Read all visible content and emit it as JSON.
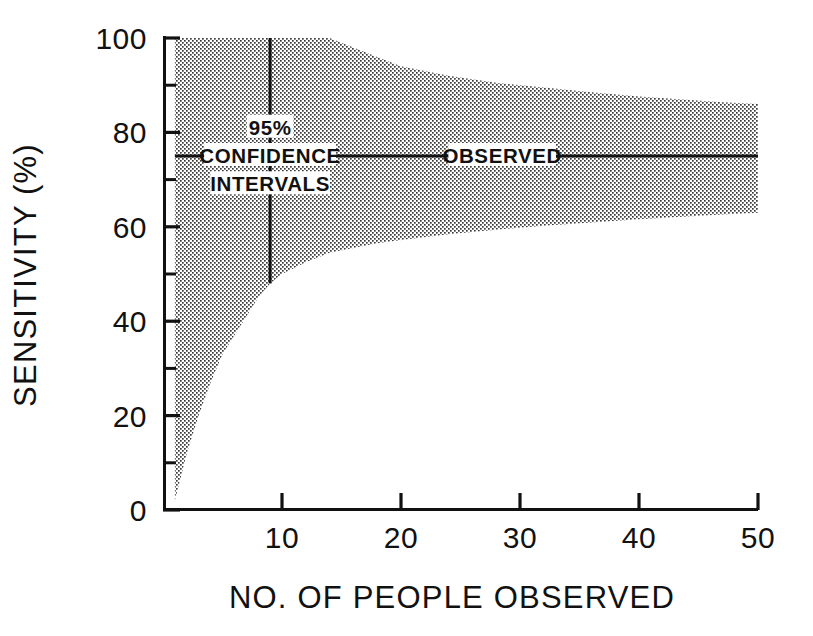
{
  "chart_data": {
    "type": "area",
    "title": "",
    "subtitle": "",
    "xlabel": "NO. OF PEOPLE OBSERVED",
    "ylabel": "SENSITIVITY (%)",
    "xlim": [
      0,
      50
    ],
    "ylim": [
      0,
      100
    ],
    "x_ticks": [
      10,
      20,
      30,
      40,
      50
    ],
    "x_tick_labels": [
      "10",
      "20",
      "30",
      "40",
      "50"
    ],
    "x_minor_ticks": [],
    "y_ticks": [
      0,
      20,
      40,
      60,
      80,
      100
    ],
    "y_tick_labels": [
      "0",
      "20",
      "40",
      "60",
      "80",
      "100"
    ],
    "y_minor_ticks": [
      10,
      30,
      50,
      70,
      90
    ],
    "grid": false,
    "legend_position": "none",
    "annotations": [
      {
        "name": "ci-label-line1",
        "text": "95%",
        "x": 9.0,
        "y": 81
      },
      {
        "name": "ci-label-line2",
        "text": "CONFIDENCE",
        "x": 9.0,
        "y": 75
      },
      {
        "name": "ci-label-line3",
        "text": "INTERVALS",
        "x": 9.0,
        "y": 69
      },
      {
        "name": "observed-label",
        "text": "OBSERVED",
        "x": 28.5,
        "y": 75
      }
    ],
    "series": [
      {
        "name": "OBSERVED",
        "type": "line",
        "value": 75,
        "x": [
          1,
          50
        ],
        "values": [
          75,
          75
        ],
        "style": "solid"
      },
      {
        "name": "95% CONFIDENCE INTERVALS",
        "type": "band",
        "x": [
          1,
          2,
          3,
          4,
          5,
          6,
          7,
          8,
          9,
          10,
          12,
          14,
          16,
          18,
          20,
          24,
          28,
          32,
          36,
          40,
          44,
          47,
          50
        ],
        "upper": [
          100,
          100,
          100,
          100,
          100,
          100,
          100,
          100,
          100,
          100,
          100,
          100,
          98,
          96,
          94,
          92,
          90.5,
          89.5,
          88.5,
          87.6,
          86.9,
          86.4,
          86.0
        ],
        "lower": [
          2,
          12,
          20,
          27,
          33,
          37,
          41,
          45,
          48,
          50,
          52.5,
          54.5,
          55.5,
          56.5,
          57.2,
          58.4,
          59.4,
          60.2,
          60.9,
          61.6,
          62.2,
          62.6,
          63.0
        ]
      }
    ],
    "error_bar": {
      "name": "sample-interval-marker",
      "x": 9,
      "low": 48,
      "high": 100
    }
  }
}
